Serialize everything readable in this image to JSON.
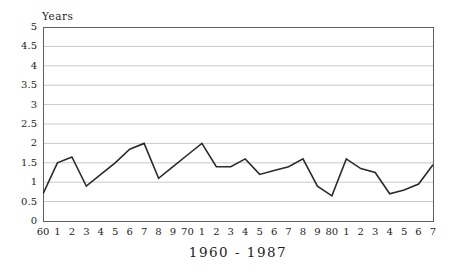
{
  "chart_data": {
    "type": "line",
    "title": "1960 - 1987",
    "ylabel": "Years",
    "xlabel": "",
    "x_years": [
      1960,
      1961,
      1962,
      1963,
      1964,
      1965,
      1966,
      1967,
      1968,
      1969,
      1970,
      1971,
      1972,
      1973,
      1974,
      1975,
      1976,
      1977,
      1978,
      1979,
      1980,
      1981,
      1982,
      1983,
      1984,
      1985,
      1986,
      1987
    ],
    "x_tick_labels": [
      "60",
      "1",
      "2",
      "3",
      "4",
      "5",
      "6",
      "7",
      "8",
      "9",
      "70",
      "1",
      "2",
      "3",
      "4",
      "5",
      "6",
      "7",
      "8",
      "9",
      "80",
      "1",
      "2",
      "3",
      "4",
      "5",
      "6",
      "7"
    ],
    "values": [
      0.7,
      1.5,
      1.65,
      0.9,
      1.2,
      1.5,
      1.85,
      2.0,
      1.1,
      1.4,
      1.7,
      2.0,
      1.4,
      1.4,
      1.6,
      1.2,
      1.3,
      1.4,
      1.6,
      0.9,
      0.65,
      1.6,
      1.35,
      1.25,
      0.7,
      0.8,
      0.95,
      1.45
    ],
    "ylim": [
      0,
      5
    ],
    "ytick_step": 0.5,
    "y_tick_labels_top_to_bottom": [
      "5",
      "4.5",
      "4",
      "3.5",
      "3",
      "2.5",
      "2",
      "1.5",
      "1",
      "0.5",
      "0"
    ],
    "grid": "horizontal",
    "legend": "none",
    "colors": {
      "line": "#2b2b2b",
      "grid": "#c9c9c9",
      "axis_border": "#5f5f5f",
      "text": "#1e1e1e",
      "background": "#ffffff"
    },
    "layout": {
      "plot_left": 43,
      "plot_top": 27,
      "plot_width": 390,
      "plot_height": 194
    }
  }
}
